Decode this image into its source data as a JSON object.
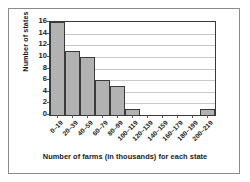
{
  "chart_data": {
    "type": "bar",
    "title": "",
    "xlabel": "Number of farms (in thousands) for each state",
    "ylabel": "Number of states",
    "categories": [
      "0–19",
      "20–39",
      "40–59",
      "60–79",
      "80–99",
      "100–119",
      "120–139",
      "140–159",
      "160–179",
      "180–199",
      "200–219"
    ],
    "values": [
      16,
      11,
      10,
      6,
      5,
      1,
      0,
      0,
      0,
      0,
      1
    ],
    "ylim": [
      0,
      16
    ],
    "ytick_values": [
      0,
      2,
      4,
      6,
      8,
      10,
      12,
      14,
      16
    ],
    "ytick_labels": [
      "0",
      "2",
      "4",
      "6",
      "8",
      "10",
      "12",
      "14",
      "16"
    ],
    "grid": "horizontal",
    "legend": "none",
    "bar_color": "#b2b2b2",
    "bar_edge_color": "#3a3a3a",
    "gridline_color": "#c8c8c8",
    "axis_color": "#3a3a3a",
    "text_color": "#1a1a1a",
    "background_color": "#ffffff",
    "frame_border_color": "#8a8a8a"
  }
}
